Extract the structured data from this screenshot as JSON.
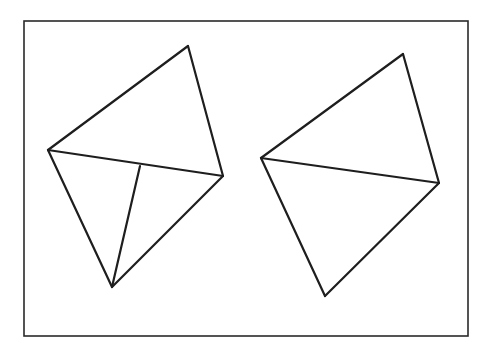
{
  "diagram": {
    "colors": {
      "stroke": "#1e1e1e",
      "frame": "#2a2a2a",
      "background": "#ffffff"
    },
    "frame": {
      "x": 24,
      "y": 21,
      "width": 444,
      "height": 315
    },
    "figures": [
      {
        "name": "left-figure",
        "vertices": {
          "apex": [
            188,
            46
          ],
          "left": [
            48,
            150
          ],
          "right": [
            223,
            176
          ],
          "bottom": [
            112,
            287
          ]
        },
        "edges": [
          [
            "left",
            "apex"
          ],
          [
            "apex",
            "right"
          ],
          [
            "left",
            "right"
          ],
          [
            "left",
            "bottom"
          ],
          [
            "bottom",
            "right"
          ]
        ],
        "extra_segment": {
          "from": [
            112,
            287
          ],
          "to": [
            140,
            166
          ]
        }
      },
      {
        "name": "right-figure",
        "vertices": {
          "apex": [
            403,
            54
          ],
          "left": [
            261,
            158
          ],
          "right": [
            439,
            183
          ],
          "bottom": [
            325,
            296
          ]
        },
        "edges": [
          [
            "left",
            "apex"
          ],
          [
            "apex",
            "right"
          ],
          [
            "left",
            "right"
          ],
          [
            "left",
            "bottom"
          ],
          [
            "bottom",
            "right"
          ]
        ]
      }
    ]
  }
}
